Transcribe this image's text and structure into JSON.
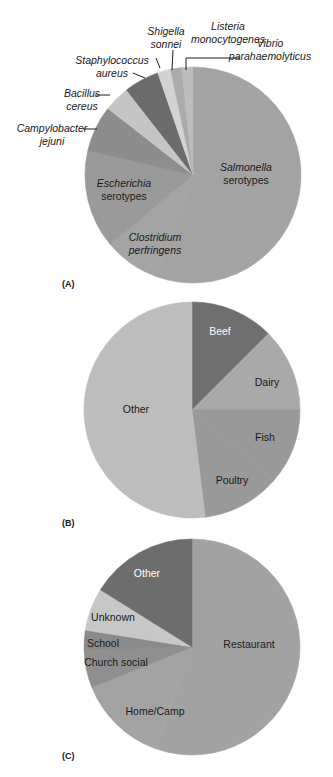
{
  "chart_data": [
    {
      "type": "pie",
      "panel_label": "(A)",
      "title": "",
      "center": [
        193,
        175
      ],
      "radius": 108,
      "slices": [
        {
          "label": "Salmonella serotypes",
          "start_deg": 0,
          "end_deg": 200,
          "color": "#a3a3a3",
          "italic_line": "Salmonella",
          "second_line": "serotypes",
          "label_pos": [
            246,
            171
          ],
          "text_color": "#1a1a1a"
        },
        {
          "label": "Clostridium perfringens",
          "start_deg": 200,
          "end_deg": 230,
          "color": "#a4a4a4",
          "italic_line": "Clostridium",
          "second_line": "perfringens",
          "label_pos": [
            155,
            241
          ],
          "text_color": "#1a1a1a",
          "both_italic": true
        },
        {
          "label": "Escherichia serotypes",
          "start_deg": 230,
          "end_deg": 283,
          "color": "#9a9a9a",
          "italic_line": "Escherichia",
          "second_line": "serotypes",
          "label_pos": [
            124,
            187
          ],
          "text_color": "#1a1a1a"
        },
        {
          "label": "Campylobacter jejuni",
          "start_deg": 283,
          "end_deg": 308,
          "color": "#8d8d8d"
        },
        {
          "label": "Bacillus cereus",
          "start_deg": 308,
          "end_deg": 322,
          "color": "#c5c5c5"
        },
        {
          "label": "Staphylococcus aureus",
          "start_deg": 322,
          "end_deg": 341,
          "color": "#6b6b6b"
        },
        {
          "label": "Shigella sonnei",
          "start_deg": 341,
          "end_deg": 348,
          "color": "#d3d3d3"
        },
        {
          "label": "Listeria monocytogenes",
          "start_deg": 348,
          "end_deg": 354,
          "color": "#ababab"
        },
        {
          "label": "Vibrio parahaemolyticus",
          "start_deg": 354,
          "end_deg": 360,
          "color": "#bcbcbc"
        }
      ],
      "outside_labels": [
        {
          "lines": [
            "Shigella",
            "sonnei"
          ],
          "x": 166,
          "y": 35,
          "anchor": "middle",
          "leader": [
            [
              156,
              58
            ],
            [
              160,
              68
            ]
          ]
        },
        {
          "lines": [
            "Listeria",
            "monocytogenes"
          ],
          "x": 228,
          "y": 30,
          "anchor": "middle",
          "leader": [
            [
              173,
              50
            ],
            [
              172,
              70
            ]
          ]
        },
        {
          "lines": [
            "Vibrio",
            "parahaemolyticus"
          ],
          "x": 270,
          "y": 47,
          "anchor": "middle",
          "leader": [
            [
              240,
              58
            ],
            [
              186,
              58
            ],
            [
              186,
              70
            ]
          ]
        },
        {
          "lines": [
            "Staphylococcus",
            "aureus"
          ],
          "x": 112,
          "y": 64,
          "anchor": "middle",
          "leader": [
            [
              133,
              73
            ],
            [
              145,
              78
            ]
          ]
        },
        {
          "lines": [
            "Bacillus",
            "cereus"
          ],
          "x": 82,
          "y": 97,
          "anchor": "middle",
          "leader": [
            [
              95,
              95
            ],
            [
              110,
              95
            ]
          ]
        },
        {
          "lines": [
            "Campylobacter",
            "jejuni"
          ],
          "x": 52,
          "y": 132,
          "anchor": "middle",
          "leader": [
            [
              83,
              129
            ],
            [
              97,
              129
            ]
          ]
        }
      ]
    },
    {
      "type": "pie",
      "panel_label": "(B)",
      "title": "",
      "center": [
        192,
        410
      ],
      "radius": 108,
      "slices": [
        {
          "label": "Beef",
          "start_deg": 0,
          "end_deg": 45,
          "color": "#6f6f6f",
          "label_pos": [
            220,
            335
          ],
          "text_color": "#ffffff"
        },
        {
          "label": "Dairy",
          "start_deg": 45,
          "end_deg": 90,
          "color": "#a9a9a9",
          "label_pos": [
            267,
            386
          ],
          "text_color": "#1a1a1a"
        },
        {
          "label": "Fish",
          "start_deg": 90,
          "end_deg": 131,
          "color": "#999999",
          "label_pos": [
            265,
            441
          ],
          "text_color": "#1a1a1a"
        },
        {
          "label": "Poultry",
          "start_deg": 131,
          "end_deg": 173,
          "color": "#999999",
          "label_pos": [
            232,
            484
          ],
          "text_color": "#1a1a1a"
        },
        {
          "label": "Other",
          "start_deg": 173,
          "end_deg": 360,
          "color": "#bdbdbd",
          "label_pos": [
            136,
            413
          ],
          "text_color": "#1a1a1a"
        }
      ]
    },
    {
      "type": "pie",
      "panel_label": "(C)",
      "title": "",
      "center": [
        192,
        647
      ],
      "radius": 108,
      "slices": [
        {
          "label": "Restaurant",
          "start_deg": 0,
          "end_deg": 200,
          "color": "#a2a2a2",
          "label_pos": [
            249,
            648
          ],
          "text_color": "#1a1a1a"
        },
        {
          "label": "Home/Camp",
          "start_deg": 200,
          "end_deg": 248,
          "color": "#a3a3a3",
          "label_pos": [
            155,
            715
          ],
          "text_color": "#1a1a1a"
        },
        {
          "label": "Church social",
          "start_deg": 248,
          "end_deg": 268,
          "color": "#8f8f8f",
          "label_pos": [
            116,
            666
          ],
          "text_color": "#1a1a1a"
        },
        {
          "label": "School",
          "start_deg": 268,
          "end_deg": 279,
          "color": "#8a8a8a",
          "label_pos": [
            103,
            647
          ],
          "text_color": "#1a1a1a"
        },
        {
          "label": "Unknown",
          "start_deg": 279,
          "end_deg": 302,
          "color": "#c7c7c7",
          "label_pos": [
            113,
            621
          ],
          "text_color": "#1a1a1a"
        },
        {
          "label": "Other",
          "start_deg": 302,
          "end_deg": 360,
          "color": "#6d6d6d",
          "label_pos": [
            147,
            577
          ],
          "text_color": "#ffffff"
        }
      ]
    }
  ],
  "panels": [
    {
      "label": "(A)",
      "x": 62,
      "y": 287
    },
    {
      "label": "(B)",
      "x": 62,
      "y": 526
    },
    {
      "label": "(C)",
      "x": 62,
      "y": 759
    }
  ]
}
